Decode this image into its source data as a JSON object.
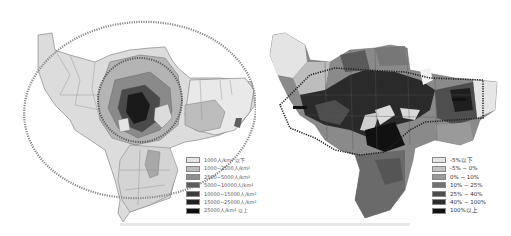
{
  "maps": {
    "left": {
      "title": "Population density map",
      "legend": [
        {
          "label": "1000人/km² 以下",
          "color": "#e6e6e6"
        },
        {
          "label": "1000~2500人/km²",
          "color": "#bdbdbd"
        },
        {
          "label": "2500~5000人/km²",
          "color": "#8f8f8f"
        },
        {
          "label": "5000~10000人/km²",
          "color": "#5e5e5e"
        },
        {
          "label": "10000~15000人/km²",
          "color": "#3c3c3c"
        },
        {
          "label": "15000~25000人/km²",
          "color": "#222222"
        },
        {
          "label": "25000人/km² 以上",
          "color": "#0d0d0d"
        }
      ]
    },
    "right": {
      "title": "Population change rate map",
      "legend": [
        {
          "label": "-5%以下",
          "color": "#e6e6e6"
        },
        {
          "label": "-5% ~ 0%",
          "color": "#c2c2c2"
        },
        {
          "label": "0% ~ 10%",
          "color": "#9a9a9a"
        },
        {
          "label": "10% ~ 25%",
          "color": "#727272"
        },
        {
          "label": "25% ~ 40%",
          "color": "#4e4e4e"
        },
        {
          "label": "40% ~ 100%",
          "color": "#2e2e2e"
        },
        {
          "label": "100%以上",
          "color": "#111111"
        }
      ]
    }
  },
  "caption": ""
}
